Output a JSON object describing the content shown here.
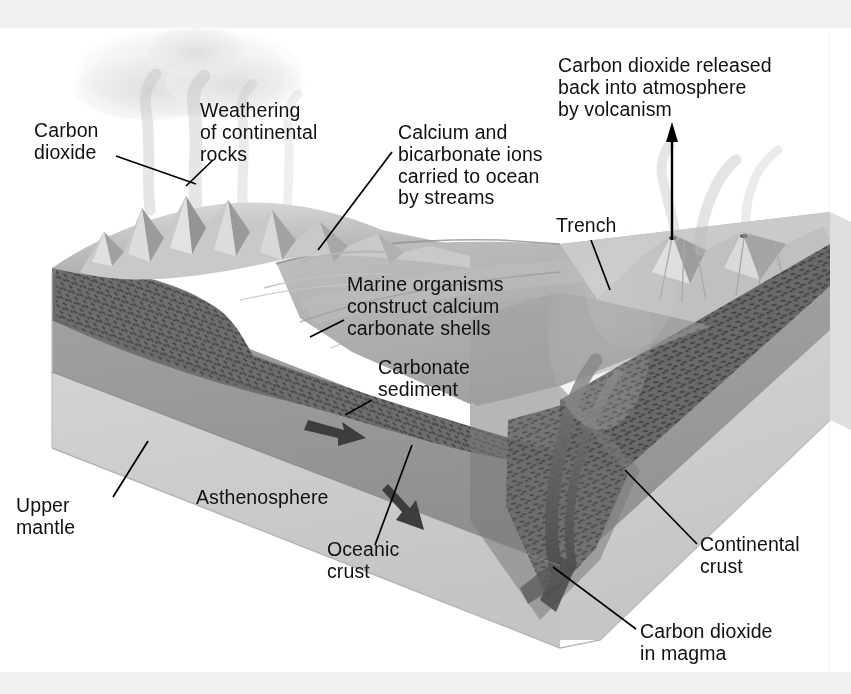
{
  "figure": {
    "kind": "block-diagram",
    "palette": {
      "background": "#ffffff",
      "scan_band": "#f0f0f0",
      "text": "#111111",
      "leader_line": "#000000",
      "continental_crust_dark": "#6e6e6e",
      "crust_hatch": "#4a4a4a",
      "upper_mantle": "#9a9a9a",
      "asthenosphere": "#cfcfcf",
      "ocean_surface": "#b9b9b9",
      "ocean_deep": "#a6a6a6",
      "land_light": "#d2d2d2",
      "land_shadow": "#8d8d8d",
      "sediment": "#c3c3c3",
      "plume": "#bdbdbd",
      "cloud": "#e4e4e4",
      "magma": "#5c5c5c"
    }
  },
  "labels": [
    {
      "id": "carbon-dioxide-atmosphere",
      "text": "Carbon\ndioxide",
      "x": 34,
      "y": 120,
      "align": "left",
      "leader": [
        [
          116,
          156
        ],
        [
          196,
          184
        ]
      ]
    },
    {
      "id": "weathering-of-continental-rocks",
      "text": "Weathering\nof continental\nrocks",
      "x": 200,
      "y": 100,
      "align": "left",
      "leader": [
        [
          213,
          160
        ],
        [
          186,
          186
        ]
      ]
    },
    {
      "id": "calcium-bicarbonate-ions",
      "text": "Calcium and\nbicarbonate ions\ncarried to ocean\nby streams",
      "x": 398,
      "y": 122,
      "align": "left",
      "leader": [
        [
          392,
          152
        ],
        [
          318,
          250
        ]
      ]
    },
    {
      "id": "carbon-dioxide-released-volcanism",
      "text": "Carbon dioxide released\nback into atmosphere\nby volcanism",
      "x": 558,
      "y": 55,
      "align": "left",
      "leader": null
    },
    {
      "id": "trench",
      "text": "Trench",
      "x": 556,
      "y": 215,
      "align": "left",
      "leader": [
        [
          591,
          240
        ],
        [
          610,
          290
        ]
      ]
    },
    {
      "id": "marine-organisms-shells",
      "text": "Marine organisms\nconstruct calcium\ncarbonate shells",
      "x": 347,
      "y": 274,
      "align": "left",
      "leader": [
        [
          344,
          320
        ],
        [
          310,
          337
        ]
      ]
    },
    {
      "id": "carbonate-sediment",
      "text": "Carbonate\nsediment",
      "x": 378,
      "y": 357,
      "align": "left",
      "leader": [
        [
          372,
          400
        ],
        [
          345,
          415
        ]
      ]
    },
    {
      "id": "upper-mantle",
      "text": "Upper\nmantle",
      "x": 16,
      "y": 495,
      "align": "left",
      "leader": [
        [
          113,
          497
        ],
        [
          148,
          441
        ]
      ]
    },
    {
      "id": "asthenosphere",
      "text": "Asthenosphere",
      "x": 196,
      "y": 487,
      "align": "left",
      "leader": null
    },
    {
      "id": "oceanic-crust",
      "text": "Oceanic\ncrust",
      "x": 327,
      "y": 539,
      "align": "left",
      "leader": [
        [
          375,
          545
        ],
        [
          412,
          445
        ]
      ]
    },
    {
      "id": "continental-crust",
      "text": "Continental\ncrust",
      "x": 700,
      "y": 534,
      "align": "left",
      "leader": [
        [
          697,
          544
        ],
        [
          625,
          470
        ]
      ]
    },
    {
      "id": "carbon-dioxide-in-magma",
      "text": "Carbon dioxide\nin magma",
      "x": 640,
      "y": 621,
      "align": "left",
      "leader": [
        [
          636,
          629
        ],
        [
          553,
          567
        ]
      ]
    }
  ],
  "arrows": [
    {
      "id": "volcanism-arrow",
      "kind": "straight-up",
      "from": [
        672,
        240
      ],
      "to": [
        672,
        128
      ]
    },
    {
      "id": "asthenosphere-flow-arrow-1",
      "kind": "block",
      "from": [
        314,
        424
      ],
      "to": [
        352,
        440
      ]
    },
    {
      "id": "subduction-flow-arrow-2",
      "kind": "block",
      "from": [
        392,
        492
      ],
      "to": [
        428,
        516
      ]
    }
  ]
}
